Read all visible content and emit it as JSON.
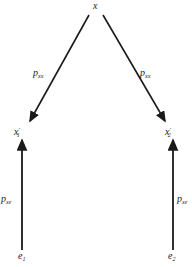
{
  "diagram": {
    "type": "path-diagram",
    "nodes": {
      "x": {
        "label": "x"
      },
      "x1": {
        "label": "x",
        "prime": "′",
        "subscript": "1"
      },
      "x2": {
        "label": "x",
        "prime": "′",
        "subscript": "2"
      },
      "e1": {
        "label": "e",
        "subscript": "1"
      },
      "e2": {
        "label": "e",
        "subscript": "2"
      }
    },
    "edges": [
      {
        "from": "x",
        "to": "x1",
        "label": "p",
        "subscript": "xx"
      },
      {
        "from": "x",
        "to": "x2",
        "label": "p",
        "subscript": "xx"
      },
      {
        "from": "e1",
        "to": "x1",
        "label": "p",
        "subscript": "xe"
      },
      {
        "from": "e2",
        "to": "x2",
        "label": "p",
        "subscript": "xe"
      }
    ],
    "colors": {
      "ink": "#1a1a1a",
      "background": "#ffffff"
    }
  }
}
